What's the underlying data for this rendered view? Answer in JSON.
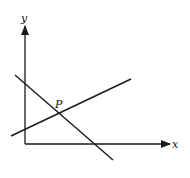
{
  "diagram": {
    "type": "coordinate-graph",
    "axes": {
      "x_label": "x",
      "y_label": "y"
    },
    "point_label": "P",
    "lines": [
      {
        "name": "ascending-line",
        "description": "positive slope, crosses y-axis above origin"
      },
      {
        "name": "descending-line",
        "description": "negative slope, crosses both axes"
      }
    ],
    "colors": {
      "stroke": "#1a1a1a",
      "background": "#ffffff"
    }
  }
}
